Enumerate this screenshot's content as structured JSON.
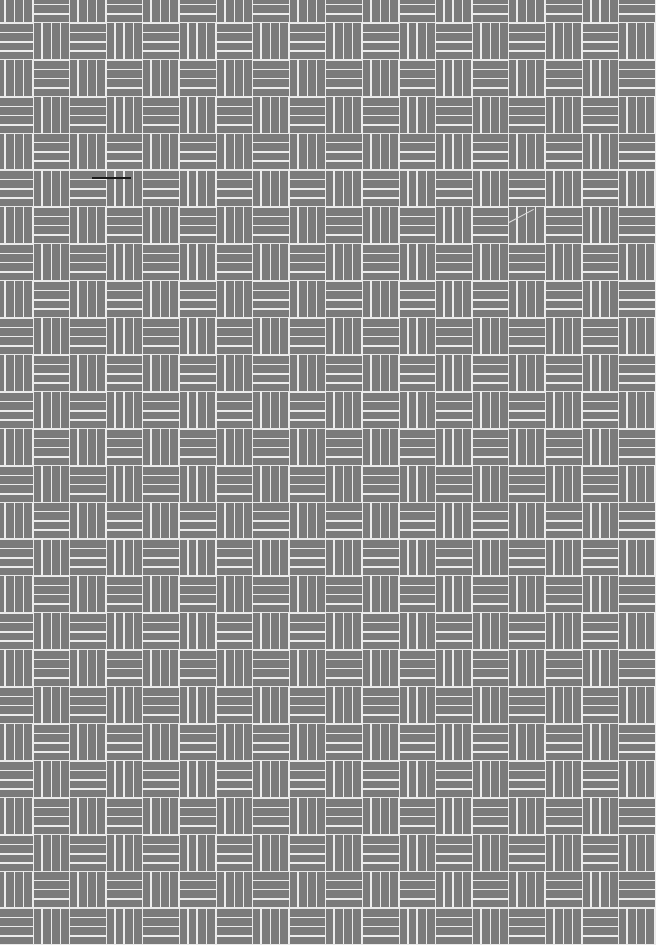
{
  "texture": {
    "name": "basketweave",
    "columns": 18,
    "rows": 26,
    "strips_per_tile": 4,
    "first_tile_orientation": "vertical",
    "colors": {
      "tile": "#7b7b7b",
      "line": "#ececec",
      "mark": "#1a1a1a"
    }
  }
}
